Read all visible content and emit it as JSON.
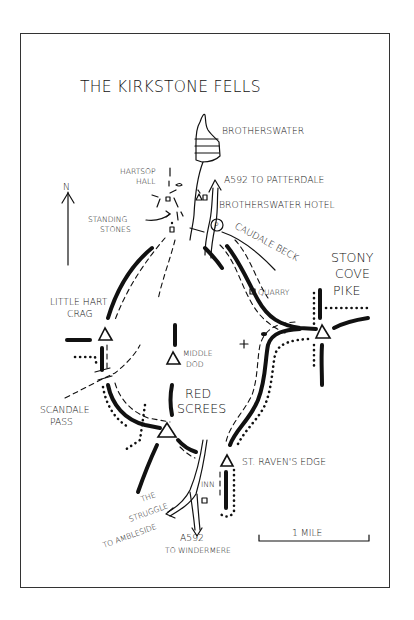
{
  "map": {
    "title": "THE KIRKSTONE FELLS",
    "north_label": "N",
    "scale_label": "1 MILE",
    "labels": {
      "brotherswater": "BROTHERSWATER",
      "hartsop_1": "HARTSOP",
      "hartsop_2": "HALL",
      "a592_patterdale": "A592 TO PATTERDALE",
      "brotherswater_hotel": "BROTHERSWATER HOTEL",
      "standing_1": "STANDING",
      "standing_2": "STONES",
      "caudale_beck": "CAUDALE BECK",
      "parking": "P",
      "stony_1": "STONY",
      "stony_2": "COVE",
      "stony_3": "PIKE",
      "quarry": "QUARRY",
      "little_hart_1": "LITTLE HART",
      "little_hart_2": "CRAG",
      "middle_dodd_1": "MIDDLE",
      "middle_dodd_2": "DOD",
      "red_screes_1": "RED",
      "red_screes_2": "SCREES",
      "scandale_1": "SCANDALE",
      "scandale_2": "PASS",
      "st_ravens_edge": "ST. RAVEN'S EDGE",
      "inn": "INN",
      "struggle_1": "THE",
      "struggle_2": "STRUGGLE",
      "struggle_3": "TO AMBLESIDE",
      "a592_windermere_1": "A592",
      "a592_windermere_2": "TO WINDERMERE"
    },
    "peaks": [
      "Little Hart Crag",
      "Middle Dod",
      "Red Screes",
      "Stony Cove Pike",
      "St. Raven's Edge"
    ],
    "legend_styles": {
      "route": "thick solid",
      "footpath": "dashed",
      "wall": "dotted"
    },
    "colors": {
      "ink": "#111111",
      "paper": "#ffffff",
      "frame": "#333333"
    }
  }
}
